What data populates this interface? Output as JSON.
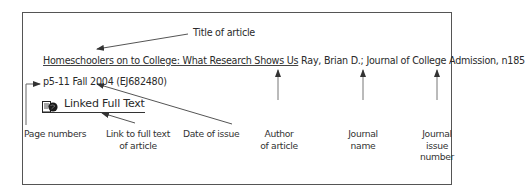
{
  "citation": {
    "title": "Homeschoolers on to College: What Research Shows Us",
    "author": "Ray, Brian D.;",
    "journal": "Journal of College Admission,",
    "issue": "n185",
    "pages": "p5-11",
    "date": "Fall 2004",
    "accession": "(EJ682480)",
    "full_text_link": "Linked Full Text",
    "full_text_icon": "document-globe-icon"
  },
  "callouts": {
    "title": "Title of article",
    "pages": "Page numbers",
    "link_line1": "Link to full text",
    "link_line2": "of article",
    "date": "Date of issue",
    "author_line1": "Author",
    "author_line2": "of article",
    "journal_line1": "Journal",
    "journal_line2": "name",
    "issue_line1": "Journal",
    "issue_line2": "issue",
    "issue_line3": "number"
  },
  "colors": {
    "ink": "#2a2a2a",
    "frame": "#555555",
    "background": "#ffffff"
  }
}
